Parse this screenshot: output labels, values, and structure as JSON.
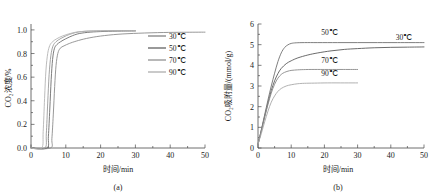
{
  "figure": {
    "panels": [
      {
        "caption": "(a)",
        "xlabel": "时间/min",
        "ylabel": "CO₂浓度/%"
      },
      {
        "caption": "(b)",
        "xlabel": "时间/min",
        "ylabel": "CO₂吸附量/(mmol/g)"
      }
    ]
  },
  "chart_data": [
    {
      "type": "line",
      "panel": "(a)",
      "title": "",
      "xlabel": "时间/min",
      "ylabel": "CO₂浓度/%",
      "xlim": [
        0,
        50
      ],
      "ylim": [
        0.0,
        1.05
      ],
      "xticks": [
        0,
        10,
        20,
        30,
        40,
        50
      ],
      "yticks": [
        "0.0",
        "0.2",
        "0.4",
        "0.6",
        "0.8",
        "1.0"
      ],
      "grid": false,
      "legend_position": "upper-right-inside",
      "series": [
        {
          "name": "30℃",
          "color": "#8c8c8c",
          "points": [
            [
              0,
              0.0
            ],
            [
              5.6,
              0.0
            ],
            [
              6.0,
              0.08
            ],
            [
              6.4,
              0.28
            ],
            [
              6.8,
              0.52
            ],
            [
              7.2,
              0.7
            ],
            [
              7.7,
              0.8
            ],
            [
              8.4,
              0.845
            ],
            [
              9.5,
              0.865
            ],
            [
              11.0,
              0.885
            ],
            [
              13.0,
              0.905
            ],
            [
              16.0,
              0.928
            ],
            [
              20.0,
              0.948
            ],
            [
              25.0,
              0.963
            ],
            [
              31.0,
              0.972
            ],
            [
              38.0,
              0.978
            ],
            [
              44.0,
              0.98
            ],
            [
              50.0,
              0.981
            ]
          ]
        },
        {
          "name": "50℃",
          "color": "#6e6e6e",
          "points": [
            [
              0,
              0.0
            ],
            [
              4.6,
              0.0
            ],
            [
              5.0,
              0.1
            ],
            [
              5.4,
              0.33
            ],
            [
              5.8,
              0.58
            ],
            [
              6.2,
              0.75
            ],
            [
              6.7,
              0.84
            ],
            [
              7.4,
              0.875
            ],
            [
              8.5,
              0.9
            ],
            [
              10.0,
              0.925
            ],
            [
              12.0,
              0.952
            ],
            [
              14.0,
              0.97
            ],
            [
              17.0,
              0.981
            ],
            [
              21.0,
              0.987
            ],
            [
              26.0,
              0.99
            ],
            [
              30.0,
              0.991
            ]
          ]
        },
        {
          "name": "70℃",
          "color": "#9a9a9a",
          "points": [
            [
              0,
              0.0
            ],
            [
              4.0,
              0.0
            ],
            [
              4.4,
              0.12
            ],
            [
              4.8,
              0.38
            ],
            [
              5.2,
              0.62
            ],
            [
              5.7,
              0.78
            ],
            [
              6.3,
              0.862
            ],
            [
              7.2,
              0.9
            ],
            [
              8.6,
              0.928
            ],
            [
              10.2,
              0.952
            ],
            [
              12.0,
              0.971
            ],
            [
              13.6,
              0.982
            ],
            [
              15.5,
              0.988
            ],
            [
              18.0,
              0.991
            ],
            [
              22.0,
              0.993
            ],
            [
              26.0,
              0.994
            ],
            [
              30.0,
              0.994
            ]
          ]
        },
        {
          "name": "90℃",
          "color": "#b4b4b4",
          "points": [
            [
              0,
              0.0
            ],
            [
              3.1,
              0.0
            ],
            [
              3.5,
              0.14
            ],
            [
              3.9,
              0.42
            ],
            [
              4.3,
              0.66
            ],
            [
              4.8,
              0.8
            ],
            [
              5.4,
              0.868
            ],
            [
              6.2,
              0.9
            ],
            [
              7.4,
              0.925
            ],
            [
              9.0,
              0.948
            ],
            [
              10.8,
              0.966
            ],
            [
              12.4,
              0.978
            ],
            [
              14.0,
              0.985
            ],
            [
              16.5,
              0.99
            ],
            [
              20.0,
              0.992
            ],
            [
              25.0,
              0.993
            ],
            [
              30.0,
              0.993
            ]
          ]
        }
      ]
    },
    {
      "type": "line",
      "panel": "(b)",
      "title": "",
      "xlabel": "时间/min",
      "ylabel": "CO₂吸附量/(mmol/g)",
      "xlim": [
        0,
        50
      ],
      "ylim": [
        0,
        6
      ],
      "xticks": [
        0,
        10,
        20,
        30,
        40,
        50
      ],
      "yticks": [
        0,
        1,
        2,
        3,
        4,
        5,
        6
      ],
      "grid": false,
      "legend_position": "inline-curve-labels",
      "series": [
        {
          "name": "30℃",
          "color": "#5a5a5a",
          "label_x": 44.0,
          "label_y": 5.25,
          "points": [
            [
              0,
              0.18
            ],
            [
              1.0,
              0.85
            ],
            [
              2.0,
              1.52
            ],
            [
              3.0,
              2.18
            ],
            [
              4.0,
              2.78
            ],
            [
              5.0,
              3.25
            ],
            [
              6.0,
              3.6
            ],
            [
              7.0,
              3.85
            ],
            [
              8.5,
              4.08
            ],
            [
              10.0,
              4.22
            ],
            [
              12.0,
              4.36
            ],
            [
              15.0,
              4.5
            ],
            [
              18.0,
              4.6
            ],
            [
              22.0,
              4.7
            ],
            [
              26.0,
              4.77
            ],
            [
              30.0,
              4.81
            ],
            [
              35.0,
              4.85
            ],
            [
              40.0,
              4.87
            ],
            [
              45.0,
              4.88
            ],
            [
              50.0,
              4.89
            ]
          ]
        },
        {
          "name": "50℃",
          "color": "#707070",
          "label_x": 21.5,
          "label_y": 5.45,
          "points": [
            [
              0,
              0.18
            ],
            [
              1.0,
              0.88
            ],
            [
              2.0,
              1.6
            ],
            [
              3.0,
              2.32
            ],
            [
              4.0,
              3.0
            ],
            [
              5.0,
              3.62
            ],
            [
              6.0,
              4.18
            ],
            [
              7.0,
              4.6
            ],
            [
              8.0,
              4.86
            ],
            [
              9.0,
              4.99
            ],
            [
              10.0,
              5.06
            ],
            [
              11.5,
              5.09
            ],
            [
              14.0,
              5.1
            ],
            [
              18.0,
              5.1
            ],
            [
              24.0,
              5.1
            ],
            [
              30.0,
              5.1
            ],
            [
              36.0,
              5.1
            ],
            [
              42.0,
              5.1
            ],
            [
              50.0,
              5.1
            ]
          ]
        },
        {
          "name": "70℃",
          "color": "#8a8a8a",
          "label_x": 21.5,
          "label_y": 4.12,
          "points": [
            [
              0,
              0.18
            ],
            [
              1.0,
              0.82
            ],
            [
              2.0,
              1.48
            ],
            [
              3.0,
              2.1
            ],
            [
              4.0,
              2.66
            ],
            [
              5.0,
              3.08
            ],
            [
              6.0,
              3.38
            ],
            [
              7.0,
              3.56
            ],
            [
              8.0,
              3.66
            ],
            [
              9.5,
              3.74
            ],
            [
              11.0,
              3.77
            ],
            [
              13.0,
              3.79
            ],
            [
              16.0,
              3.8
            ],
            [
              20.0,
              3.8
            ],
            [
              25.0,
              3.8
            ],
            [
              30.0,
              3.8
            ]
          ]
        },
        {
          "name": "90℃",
          "color": "#a8a8a8",
          "label_x": 21.5,
          "label_y": 3.46,
          "points": [
            [
              0,
              0.18
            ],
            [
              1.0,
              0.7
            ],
            [
              2.0,
              1.26
            ],
            [
              3.0,
              1.78
            ],
            [
              4.0,
              2.22
            ],
            [
              5.0,
              2.52
            ],
            [
              6.0,
              2.74
            ],
            [
              7.0,
              2.88
            ],
            [
              8.5,
              3.0
            ],
            [
              10.0,
              3.06
            ],
            [
              12.0,
              3.11
            ],
            [
              14.0,
              3.13
            ],
            [
              17.0,
              3.14
            ],
            [
              21.0,
              3.15
            ],
            [
              26.0,
              3.15
            ],
            [
              30.0,
              3.15
            ]
          ]
        }
      ]
    }
  ]
}
